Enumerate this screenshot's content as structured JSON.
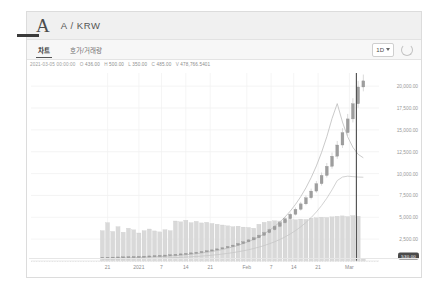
{
  "header": {
    "logo_letter": "A",
    "pair": "A / KRW"
  },
  "tabs": [
    {
      "label": "차트",
      "active": true
    },
    {
      "label": "호가/거래량",
      "active": false
    }
  ],
  "toolbar": {
    "timeframe": "1D",
    "caret_icon": "chevron-down-icon",
    "refresh_icon": "refresh-icon"
  },
  "ohlc": {
    "timestamp": "2021-03-05 00:00:00",
    "o_key": "O",
    "o_val": "436.00",
    "h_key": "H",
    "h_val": "500.00",
    "l_key": "L",
    "l_val": "350.00",
    "c_key": "C",
    "c_val": "485.00",
    "v_key": "V",
    "v_val": "478,766.5401"
  },
  "last_price": "530.00",
  "chart_data": {
    "type": "line",
    "title": "A / KRW",
    "xlabel": "",
    "ylabel": "",
    "grid": true,
    "legend_position": "top-left",
    "ylim": [
      0,
      21500
    ],
    "yticks": [
      2500,
      5000,
      7500,
      10000,
      12500,
      15000,
      17500,
      20000
    ],
    "ytick_labels": [
      "2,500.00",
      "5,000.00",
      "7,500.00",
      "10,000.00",
      "12,500.00",
      "15,000.00",
      "17,500.00",
      "20,000.00"
    ],
    "xtick_labels": [
      "21",
      "2021",
      "7",
      "14",
      "21",
      "Feb",
      "7",
      "14",
      "21",
      "Mar"
    ],
    "xtick_positions": [
      0.22,
      0.31,
      0.375,
      0.445,
      0.515,
      0.62,
      0.69,
      0.755,
      0.825,
      0.915
    ],
    "series": [
      {
        "name": "price-candles",
        "type": "candle",
        "values": [
          420,
          430,
          445,
          460,
          475,
          490,
          510,
          530,
          555,
          580,
          610,
          645,
          680,
          720,
          765,
          815,
          870,
          930,
          1000,
          1080,
          1170,
          1270,
          1385,
          1510,
          1655,
          1815,
          1995,
          2195,
          2415,
          2665,
          2940,
          3245,
          3585,
          3960,
          4375,
          4835,
          5345,
          5910,
          6535,
          7230,
          7995,
          8845,
          9785,
          10830,
          11985,
          13265,
          14680,
          16250,
          17985,
          19900,
          20600
        ]
      },
      {
        "name": "ma-fast",
        "type": "line",
        "values": [
          300,
          310,
          322,
          335,
          350,
          366,
          384,
          404,
          426,
          450,
          477,
          507,
          540,
          577,
          618,
          664,
          716,
          774,
          840,
          914,
          998,
          1092,
          1199,
          1320,
          1457,
          1612,
          1788,
          1988,
          2216,
          2476,
          2773,
          3112,
          3500,
          3944,
          4453,
          5036,
          5704,
          6470,
          7350,
          8362,
          9527,
          10870,
          12421,
          14213,
          16287,
          18000,
          15900,
          14200,
          13000,
          12200,
          11800
        ]
      },
      {
        "name": "ma-slow",
        "type": "line",
        "values": [
          220,
          224,
          229,
          235,
          242,
          250,
          259,
          269,
          281,
          294,
          309,
          326,
          345,
          366,
          390,
          417,
          447,
          481,
          519,
          562,
          610,
          664,
          725,
          794,
          871,
          958,
          1056,
          1166,
          1290,
          1430,
          1588,
          1767,
          1969,
          2198,
          2458,
          2754,
          3090,
          3472,
          3907,
          4402,
          4966,
          5609,
          6343,
          7180,
          8137,
          9200,
          9600,
          9700,
          9650,
          9600,
          9580
        ]
      },
      {
        "name": "volume-bars",
        "type": "bar",
        "values": [
          1900,
          2400,
          1850,
          2150,
          1800,
          2050,
          1950,
          1750,
          1900,
          2000,
          1880,
          1820,
          1960,
          1900,
          2500,
          2450,
          2550,
          2400,
          2480,
          2380,
          2420,
          2350,
          2300,
          2250,
          2200,
          2150,
          2180,
          2120,
          2100,
          2050,
          2300,
          2420,
          2480,
          2520,
          2500,
          2560,
          2600,
          2580,
          2620,
          2600,
          2680,
          2700,
          2740,
          2720,
          2760,
          2800,
          2820,
          2780,
          2840,
          2800,
          120
        ]
      }
    ],
    "cursor_line_x": 0.935,
    "annotations": []
  }
}
